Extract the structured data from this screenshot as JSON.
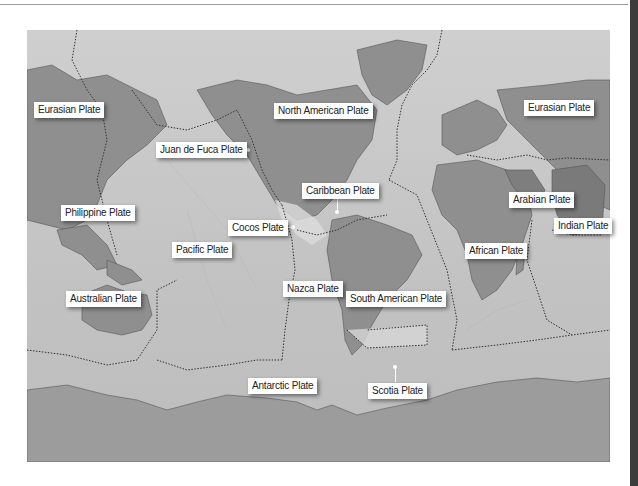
{
  "map": {
    "title": "Tectonic plates world map",
    "colors": {
      "ocean": "#c4c4c4",
      "land": "#8f8f8f",
      "antarctica": "#9c9c9c",
      "boundary": "#3a3a3a",
      "label_bg": "#ffffff",
      "border_strip": "#3c3c3c"
    },
    "plates": [
      {
        "id": "eurasian-west",
        "label": "Eurasian Plate",
        "x": 34,
        "y": 102
      },
      {
        "id": "north-american",
        "label": "North American Plate",
        "x": 274,
        "y": 103
      },
      {
        "id": "eurasian-east",
        "label": "Eurasian Plate",
        "x": 524,
        "y": 100
      },
      {
        "id": "juan-de-fuca",
        "label": "Juan de Fuca Plate",
        "x": 156,
        "y": 142
      },
      {
        "id": "caribbean",
        "label": "Caribbean Plate",
        "x": 302,
        "y": 183
      },
      {
        "id": "arabian",
        "label": "Arabian Plate",
        "x": 509,
        "y": 192
      },
      {
        "id": "philippine",
        "label": "Philippine Plate",
        "x": 61,
        "y": 205
      },
      {
        "id": "cocos",
        "label": "Cocos Plate",
        "x": 228,
        "y": 220
      },
      {
        "id": "indian",
        "label": "Indian Plate",
        "x": 554,
        "y": 218
      },
      {
        "id": "pacific",
        "label": "Pacific Plate",
        "x": 172,
        "y": 242
      },
      {
        "id": "african",
        "label": "African Plate",
        "x": 465,
        "y": 243
      },
      {
        "id": "nazca",
        "label": "Nazca Plate",
        "x": 283,
        "y": 281
      },
      {
        "id": "australian",
        "label": "Australian Plate",
        "x": 66,
        "y": 291
      },
      {
        "id": "south-american",
        "label": "South American Plate",
        "x": 346,
        "y": 291
      },
      {
        "id": "antarctic",
        "label": "Antarctic Plate",
        "x": 248,
        "y": 378
      },
      {
        "id": "scotia",
        "label": "Scotia Plate",
        "x": 368,
        "y": 383
      }
    ]
  }
}
